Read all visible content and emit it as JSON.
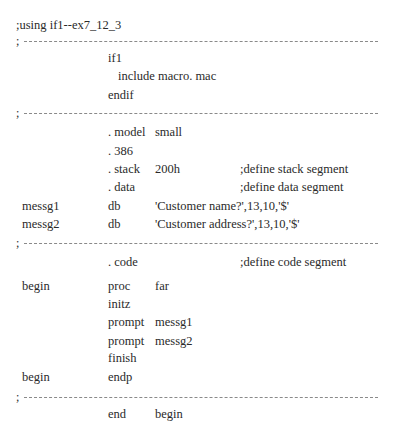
{
  "title": ";using if1--ex7_12_3",
  "divider_char": ";",
  "lines": [
    {
      "label": "",
      "op": "if1",
      "arg": "",
      "comment": ""
    },
    {
      "include": "include macro. mac"
    },
    {
      "label": "",
      "op": "endif",
      "arg": "",
      "comment": ""
    },
    {
      "label": "",
      "op": ". model",
      "arg": "small",
      "comment": ""
    },
    {
      "label": "",
      "op": ". 386",
      "arg": "",
      "comment": ""
    },
    {
      "label": "",
      "op": ". stack",
      "arg": "200h",
      "comment": ";define stack segment"
    },
    {
      "label": "",
      "op": ". data",
      "arg": "",
      "comment": ";define data segment"
    },
    {
      "label": "messg1",
      "op": "db",
      "arg": "'Customer name?',13,10,'$'",
      "comment": ""
    },
    {
      "label": "messg2",
      "op": "db",
      "arg": "'Customer address?',13,10,'$'",
      "comment": ""
    },
    {
      "label": "",
      "op": ". code",
      "arg": "",
      "comment": ";define code segment"
    },
    {
      "label": "begin",
      "op": "proc",
      "arg": "far",
      "comment": ""
    },
    {
      "label": "",
      "op": "initz",
      "arg": "",
      "comment": ""
    },
    {
      "label": "",
      "op": "prompt",
      "arg": "messg1",
      "comment": ""
    },
    {
      "label": "",
      "op": "prompt",
      "arg": "messg2",
      "comment": ""
    },
    {
      "label": "",
      "op": "finish",
      "arg": "",
      "comment": ""
    },
    {
      "label": "begin",
      "op": "endp",
      "arg": "",
      "comment": ""
    },
    {
      "label": "",
      "op": "end",
      "arg": "begin",
      "comment": ""
    }
  ]
}
